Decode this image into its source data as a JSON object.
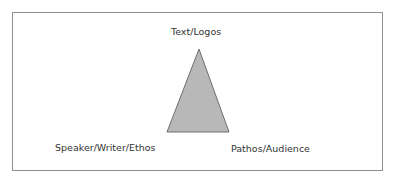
{
  "diagram": {
    "type": "rhetorical-triangle",
    "vertices": {
      "top": "Text/Logos",
      "bottom_left": "Speaker/Writer/Ethos",
      "bottom_right": "Pathos/Audience"
    },
    "colors": {
      "triangle_fill": "#b8b8b8",
      "triangle_stroke": "#6e6e6e",
      "frame_border": "#8f8f8f",
      "text": "#333333"
    }
  }
}
